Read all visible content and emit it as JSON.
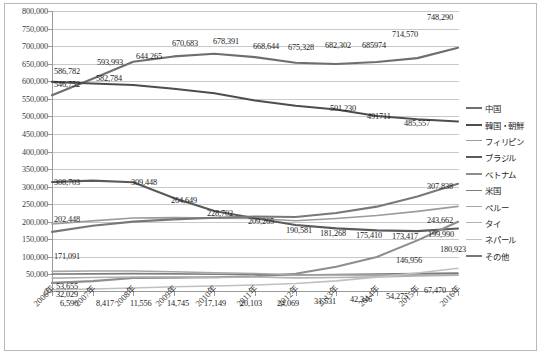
{
  "chart_data": {
    "type": "line",
    "title": "",
    "subtitle": "",
    "xlabel": "",
    "ylabel": "",
    "grid": true,
    "legend_position": "right",
    "ylim": [
      0,
      800000
    ],
    "ytick_step": 50000,
    "ytick_labels": [
      "800,000",
      "750,000",
      "700,000",
      "650,000",
      "600,000",
      "550,000",
      "500,000",
      "450,000",
      "400,000",
      "350,000",
      "300,000",
      "250,000",
      "200,000",
      "150,000",
      "100,000",
      "50,000",
      "0"
    ],
    "categories": [
      "2006年",
      "2007年",
      "2008年",
      "2009年",
      "2010年",
      "2011年",
      "2012年",
      "2013年",
      "2014年",
      "2015年",
      "2016年"
    ],
    "series": [
      {
        "name": "中国",
        "color": "#6e6e6e",
        "width": 2.1,
        "values": [
          560058,
          606889,
          655377,
          670683,
          678391,
          668644,
          652555,
          649078,
          654777,
          665847,
          695522
        ],
        "labels": [
          "",
          "593,993",
          "644,265",
          "670,683",
          "678,391",
          "668,644",
          "675,328",
          "682,302",
          "685974",
          "714,570",
          "748,290"
        ],
        "label_values": [
          null,
          593993,
          644265,
          670683,
          678391,
          668644,
          675328,
          682302,
          685974,
          714570,
          748290
        ]
      },
      {
        "name": "韓国・朝鮮",
        "color": "#4d4d4d",
        "width": 2.1,
        "values": [
          598219,
          593489,
          589239,
          578495,
          565989,
          545401,
          530048,
          519740,
          501230,
          491711,
          485557
        ],
        "labels": [
          "586,782",
          "582,784",
          "",
          "",
          "",
          "",
          "",
          "",
          "501,230",
          "491711",
          "485,557"
        ],
        "label_values": [
          586782,
          582784,
          null,
          null,
          null,
          null,
          null,
          null,
          501230,
          491711,
          485557
        ]
      },
      {
        "name": "フィリピン",
        "color": "#9b9b9b",
        "width": 1.6,
        "values": [
          193488,
          202592,
          210617,
          211716,
          210181,
          209376,
          202985,
          209183,
          217585,
          229595,
          243662
        ],
        "labels": [
          "202,448",
          "",
          "",
          "",
          "",
          "209,265",
          "",
          "",
          "",
          "",
          "243,662"
        ],
        "label_values": [
          202448,
          null,
          null,
          null,
          null,
          209265,
          null,
          null,
          null,
          null,
          243662
        ]
      },
      {
        "name": "ブラジル",
        "color": "#5a5a5a",
        "width": 2.1,
        "values": [
          312979,
          316967,
          312582,
          267456,
          230552,
          210032,
          190581,
          181268,
          175410,
          173437,
          180923
        ],
        "labels": [
          "308,703",
          "",
          "309,448",
          "264,649",
          "228,702",
          "",
          "190,581",
          "181,268",
          "175,410",
          "173,417",
          "180,923"
        ],
        "label_values": [
          308703,
          null,
          309448,
          264649,
          228702,
          null,
          190581,
          181268,
          175410,
          173417,
          180923
        ]
      },
      {
        "name": "ベトナム",
        "color": "#8d8d8d",
        "width": 2.1,
        "values": [
          26018,
          31000,
          40000,
          41000,
          42000,
          45000,
          52000,
          72000,
          99865,
          146956,
          199990
        ],
        "labels": [
          "",
          "",
          "",
          "",
          "",
          "",
          "",
          "",
          "",
          "146,956",
          "199,990"
        ],
        "label_values": [
          null,
          null,
          null,
          null,
          null,
          null,
          null,
          null,
          null,
          146956,
          199990
        ]
      },
      {
        "name": "米国",
        "color": "#7c7c7c",
        "width": 1.6,
        "values": [
          51321,
          51851,
          52683,
          52149,
          50667,
          49815,
          48357,
          49981,
          51256,
          52271,
          53705
        ],
        "labels": [
          "53,655",
          "",
          "",
          "",
          "",
          "",
          "",
          "",
          "",
          "",
          "67,470"
        ],
        "label_values": [
          53655,
          null,
          null,
          null,
          null,
          null,
          null,
          null,
          null,
          null,
          67470
        ]
      },
      {
        "name": "ペルー",
        "color": "#a5a5a5",
        "width": 1.6,
        "values": [
          58721,
          59696,
          59723,
          57464,
          54636,
          52842,
          49255,
          48598,
          47978,
          47721,
          47740
        ],
        "labels": [
          "",
          "",
          "",
          "",
          "",
          "",
          "",
          "",
          "",
          "54,275",
          ""
        ],
        "label_values": [
          null,
          null,
          null,
          null,
          null,
          null,
          null,
          null,
          null,
          54275,
          null
        ]
      },
      {
        "name": "タイ",
        "color": "#b2b2b2",
        "width": 1.6,
        "values": [
          39618,
          41354,
          42609,
          42686,
          41279,
          42750,
          40133,
          41208,
          43081,
          45379,
          47647
        ],
        "labels": [
          "32,029",
          "",
          "",
          "",
          "",
          "",
          "",
          "",
          "",
          "",
          ""
        ],
        "label_values": [
          32029,
          null,
          null,
          null,
          null,
          null,
          null,
          null,
          null,
          null,
          null
        ]
      },
      {
        "name": "ネパール",
        "color": "#c0c0c0",
        "width": 1.6,
        "values": [
          6596,
          8417,
          11556,
          14745,
          17149,
          20103,
          24069,
          31531,
          42346,
          54275,
          67470
        ],
        "labels": [
          "6,596",
          "8,417",
          "11,556",
          "14,745",
          "17,149",
          "20,103",
          "24,069",
          "31,531",
          "42,346",
          "",
          ""
        ],
        "label_values": [
          6596,
          8417,
          11556,
          14745,
          17149,
          20103,
          24069,
          31531,
          42346,
          null,
          null
        ]
      },
      {
        "name": "その他",
        "color": "#787878",
        "width": 2.1,
        "values": [
          171091,
          188500,
          200400,
          206800,
          211500,
          214800,
          213500,
          224900,
          243000,
          272000,
          307838
        ],
        "labels": [
          "171,091",
          "",
          "",
          "",
          "",
          "",
          "",
          "",
          "",
          "",
          "307,838"
        ],
        "label_values": [
          171091,
          null,
          null,
          null,
          null,
          null,
          null,
          null,
          null,
          null,
          307838
        ]
      }
    ],
    "floating_labels": [
      {
        "text": "546,752",
        "x": 54,
        "y": 80
      },
      {
        "text": "586,782",
        "x": 54,
        "y": 67
      },
      {
        "text": "593,993",
        "x": 97,
        "y": 58
      },
      {
        "text": "582,784",
        "x": 96,
        "y": 74
      },
      {
        "text": "644,265",
        "x": 136,
        "y": 52
      },
      {
        "text": "670,683",
        "x": 172,
        "y": 39
      },
      {
        "text": "678,391",
        "x": 213,
        "y": 37
      },
      {
        "text": "668,644",
        "x": 253,
        "y": 42
      },
      {
        "text": "675,328",
        "x": 288,
        "y": 43
      },
      {
        "text": "682,302",
        "x": 325,
        "y": 41
      },
      {
        "text": "685974",
        "x": 362,
        "y": 41
      },
      {
        "text": "714,570",
        "x": 392,
        "y": 30
      },
      {
        "text": "748,290",
        "x": 427,
        "y": 13
      },
      {
        "text": "501,230",
        "x": 330,
        "y": 104
      },
      {
        "text": "491711",
        "x": 367,
        "y": 112
      },
      {
        "text": "485,557",
        "x": 404,
        "y": 119
      },
      {
        "text": "308,703",
        "x": 54,
        "y": 178
      },
      {
        "text": "309,448",
        "x": 131,
        "y": 178
      },
      {
        "text": "264,649",
        "x": 171,
        "y": 196
      },
      {
        "text": "228,702",
        "x": 207,
        "y": 209
      },
      {
        "text": "209,265",
        "x": 248,
        "y": 217
      },
      {
        "text": "190,581",
        "x": 286,
        "y": 226
      },
      {
        "text": "181,268",
        "x": 320,
        "y": 229
      },
      {
        "text": "175,410",
        "x": 356,
        "y": 231
      },
      {
        "text": "173,417",
        "x": 392,
        "y": 232
      },
      {
        "text": "199,990",
        "x": 428,
        "y": 230
      },
      {
        "text": "180,923",
        "x": 440,
        "y": 245
      },
      {
        "text": "146,956",
        "x": 396,
        "y": 256
      },
      {
        "text": "307,838",
        "x": 427,
        "y": 182
      },
      {
        "text": "243,662",
        "x": 427,
        "y": 216
      },
      {
        "text": "202,448",
        "x": 54,
        "y": 215
      },
      {
        "text": "171,091",
        "x": 54,
        "y": 252
      },
      {
        "text": "53,655",
        "x": 56,
        "y": 282
      },
      {
        "text": "32,029",
        "x": 56,
        "y": 290
      },
      {
        "text": "6,596",
        "x": 60,
        "y": 299
      },
      {
        "text": "8,417",
        "x": 96,
        "y": 299
      },
      {
        "text": "11,556",
        "x": 130,
        "y": 299
      },
      {
        "text": "14,745",
        "x": 167,
        "y": 299
      },
      {
        "text": "17,149",
        "x": 204,
        "y": 299
      },
      {
        "text": "20,103",
        "x": 240,
        "y": 299
      },
      {
        "text": "24,069",
        "x": 277,
        "y": 299
      },
      {
        "text": "31,531",
        "x": 314,
        "y": 297
      },
      {
        "text": "42,346",
        "x": 350,
        "y": 295
      },
      {
        "text": "54,275",
        "x": 386,
        "y": 292
      },
      {
        "text": "67,470",
        "x": 424,
        "y": 286
      }
    ]
  }
}
